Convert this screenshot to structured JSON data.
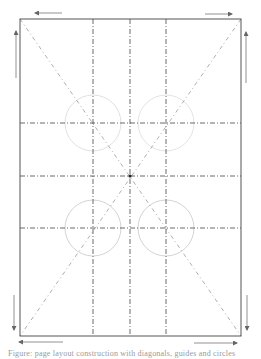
{
  "figure": {
    "frame": {
      "x": 20,
      "y": 19,
      "width": 221,
      "height": 317,
      "stroke": "#555555"
    },
    "diagonals": [
      {
        "x1": 20,
        "y1": 19,
        "x2": 241,
        "y2": 336
      },
      {
        "x1": 241,
        "y1": 19,
        "x2": 20,
        "y2": 336
      }
    ],
    "vertical_guides": [
      93,
      130,
      166
    ],
    "horizontal_guides": [
      123,
      176,
      228
    ],
    "center": {
      "x": 130,
      "y": 176
    },
    "circles": [
      {
        "name": "top-left",
        "cx": 93,
        "cy": 123,
        "r": 28,
        "stroke": "#d8d8d8"
      },
      {
        "name": "top-right",
        "cx": 166,
        "cy": 123,
        "r": 28,
        "stroke": "#dcdcdc"
      },
      {
        "name": "bottom-left",
        "cx": 93,
        "cy": 228,
        "r": 28,
        "stroke": "#c8c8c8"
      },
      {
        "name": "bottom-right",
        "cx": 166,
        "cy": 228,
        "r": 28,
        "stroke": "#c8c8c8"
      }
    ],
    "arrows": [
      {
        "name": "top-left-arrow",
        "direction": "left",
        "x1": 62,
        "y1": 13,
        "x2": 35,
        "y2": 13
      },
      {
        "name": "top-right-arrow",
        "direction": "right",
        "x1": 205,
        "y1": 14,
        "x2": 232,
        "y2": 14
      },
      {
        "name": "left-upper-arrow",
        "direction": "up",
        "x1": 16,
        "y1": 78,
        "x2": 16,
        "y2": 31
      },
      {
        "name": "right-upper-arrow",
        "direction": "up",
        "x1": 246,
        "y1": 83,
        "x2": 246,
        "y2": 32
      },
      {
        "name": "left-lower-arrow",
        "direction": "down",
        "x1": 14,
        "y1": 295,
        "x2": 14,
        "y2": 330
      },
      {
        "name": "right-lower-arrow",
        "direction": "down",
        "x1": 247,
        "y1": 295,
        "x2": 247,
        "y2": 330
      },
      {
        "name": "bottom-left-arrow",
        "direction": "left",
        "x1": 63,
        "y1": 342,
        "x2": 19,
        "y2": 342
      },
      {
        "name": "bottom-right-arrow",
        "direction": "right",
        "x1": 194,
        "y1": 343,
        "x2": 237,
        "y2": 343
      }
    ],
    "caption": "Figure: page layout construction with diagonals, guides and circles"
  }
}
